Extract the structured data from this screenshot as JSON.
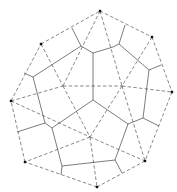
{
  "diagram": {
    "type": "delaunay-voronoi",
    "colors": {
      "background": "#ffffff",
      "dashed": "#555555",
      "solid": "#444444",
      "point": "#111111"
    },
    "sites": [
      [
        100,
        11
      ],
      [
        152,
        37
      ],
      [
        172,
        92
      ],
      [
        145,
        161
      ],
      [
        97,
        187
      ],
      [
        25,
        162
      ],
      [
        11,
        101
      ],
      [
        41,
        44
      ],
      [
        63,
        86
      ],
      [
        122,
        86
      ],
      [
        90,
        137
      ]
    ],
    "dashed_edges": [
      [
        0,
        1
      ],
      [
        1,
        2
      ],
      [
        2,
        3
      ],
      [
        3,
        4
      ],
      [
        4,
        5
      ],
      [
        5,
        6
      ],
      [
        6,
        7
      ],
      [
        7,
        0
      ],
      [
        0,
        8
      ],
      [
        0,
        9
      ],
      [
        7,
        8
      ],
      [
        1,
        9
      ],
      [
        6,
        8
      ],
      [
        8,
        9
      ],
      [
        9,
        2
      ],
      [
        9,
        3
      ],
      [
        8,
        10
      ],
      [
        9,
        10
      ],
      [
        10,
        5
      ],
      [
        10,
        4
      ],
      [
        10,
        3
      ],
      [
        6,
        10
      ]
    ],
    "voronoi_vertices": [
      [
        81,
        46
      ],
      [
        93,
        53
      ],
      [
        113,
        47
      ],
      [
        119,
        44
      ],
      [
        125,
        25
      ],
      [
        72,
        28
      ],
      [
        149,
        70
      ],
      [
        161,
        65
      ],
      [
        93,
        100
      ],
      [
        33,
        77
      ],
      [
        24,
        73
      ],
      [
        45,
        123
      ],
      [
        52,
        128
      ],
      [
        17,
        132
      ],
      [
        128,
        124
      ],
      [
        143,
        118
      ],
      [
        159,
        126
      ],
      [
        62,
        166
      ],
      [
        115,
        160
      ],
      [
        61,
        175
      ],
      [
        122,
        173
      ]
    ],
    "solid_edges": [
      [
        0,
        1
      ],
      [
        1,
        2
      ],
      [
        2,
        3
      ],
      [
        3,
        4
      ],
      [
        0,
        5
      ],
      [
        3,
        6
      ],
      [
        6,
        7
      ],
      [
        1,
        8
      ],
      [
        0,
        9
      ],
      [
        9,
        10
      ],
      [
        9,
        11
      ],
      [
        11,
        12
      ],
      [
        11,
        13
      ],
      [
        8,
        12
      ],
      [
        8,
        14
      ],
      [
        14,
        15
      ],
      [
        15,
        6
      ],
      [
        15,
        16
      ],
      [
        12,
        17
      ],
      [
        17,
        18
      ],
      [
        18,
        14
      ],
      [
        17,
        19
      ],
      [
        18,
        20
      ]
    ]
  }
}
